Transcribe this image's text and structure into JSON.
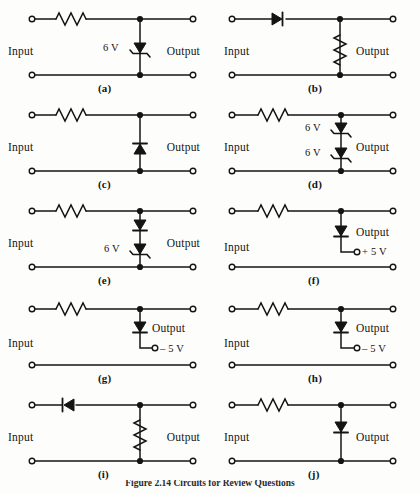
{
  "figure": {
    "caption": "Figure 2.14  Circuits for Review Questions",
    "background_color": "#fdfdfc",
    "ink_color": "#141414"
  },
  "common": {
    "input_label": "Input",
    "output_label": "Output"
  },
  "panels": [
    {
      "id": "a",
      "letter": "(a)",
      "input_label": "Input",
      "output_label": "Output",
      "series_element": "resistor",
      "shunt_element": "zener-diode",
      "shunt_value": "6 V",
      "bottom_rail": true,
      "supply_label": null
    },
    {
      "id": "b",
      "letter": "(b)",
      "input_label": "Input",
      "output_label": "Output",
      "series_element": "diode-right",
      "shunt_element": "resistor",
      "shunt_value": null,
      "bottom_rail": true,
      "supply_label": null
    },
    {
      "id": "c",
      "letter": "(c)",
      "input_label": "Input",
      "output_label": "Output",
      "series_element": "resistor",
      "shunt_element": "diode-up",
      "shunt_value": null,
      "bottom_rail": true,
      "supply_label": null
    },
    {
      "id": "d",
      "letter": "(d)",
      "input_label": "Input",
      "output_label": "Output",
      "series_element": "resistor",
      "shunt_element": "zener-pair",
      "shunt_value_top": "6 V",
      "shunt_value_bottom": "6 V",
      "bottom_rail": true,
      "supply_label": null
    },
    {
      "id": "e",
      "letter": "(e)",
      "input_label": "Input",
      "output_label": "Output",
      "series_element": "resistor",
      "shunt_element": "diode-zener-stack",
      "shunt_value": "6 V",
      "bottom_rail": true,
      "supply_label": null
    },
    {
      "id": "f",
      "letter": "(f)",
      "input_label": "Input",
      "output_label": "Output",
      "series_element": "resistor",
      "shunt_element": "diode-down-to-supply",
      "shunt_value": null,
      "bottom_rail": true,
      "supply_label": "+ 5 V"
    },
    {
      "id": "g",
      "letter": "(g)",
      "input_label": "Input",
      "output_label": "Output",
      "series_element": "resistor",
      "shunt_element": "diode-down-to-supply",
      "shunt_value": null,
      "bottom_rail": true,
      "supply_label": "– 5 V"
    },
    {
      "id": "h",
      "letter": "(h)",
      "input_label": "Input",
      "output_label": "Output",
      "series_element": "resistor",
      "shunt_element": "diode-down-to-supply",
      "shunt_value": null,
      "bottom_rail": true,
      "supply_label": "– 5 V"
    },
    {
      "id": "i",
      "letter": "(i)",
      "input_label": "Input",
      "output_label": "Output",
      "series_element": "diode-left",
      "shunt_element": "resistor",
      "shunt_value": null,
      "bottom_rail": true,
      "supply_label": null
    },
    {
      "id": "j",
      "letter": "(j)",
      "input_label": "Input",
      "output_label": "Output",
      "series_element": "resistor",
      "shunt_element": "diode-down",
      "shunt_value": null,
      "bottom_rail": true,
      "supply_label": null
    }
  ]
}
